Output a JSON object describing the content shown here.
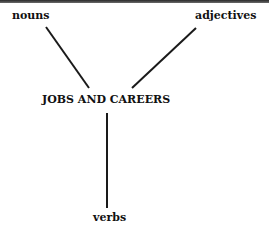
{
  "diagram": {
    "center": "JOBS AND CAREERS",
    "branches": [
      {
        "label": "nouns",
        "position": "top-left"
      },
      {
        "label": "adjectives",
        "position": "top-right"
      },
      {
        "label": "verbs",
        "position": "bottom"
      }
    ]
  }
}
